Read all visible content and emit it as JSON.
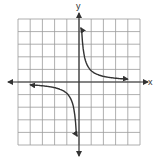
{
  "chart_data": {
    "type": "line",
    "title": "",
    "xlabel": "x",
    "ylabel": "y",
    "xlim": [
      -5,
      5
    ],
    "ylim": [
      -5,
      5
    ],
    "grid": true,
    "grid_step": 1,
    "legend": null,
    "function": "y = 1/x (rectangular hyperbola)",
    "series": [
      {
        "name": "branch-quadrant-I",
        "x": [
          0.15,
          0.25,
          0.5,
          1,
          2,
          3,
          4
        ],
        "y": [
          4.3,
          3.0,
          1.6,
          0.9,
          0.45,
          0.3,
          0.2
        ],
        "arrows": "both"
      },
      {
        "name": "branch-quadrant-III",
        "x": [
          -4,
          -3,
          -2,
          -1,
          -0.5,
          -0.25,
          -0.15
        ],
        "y": [
          -0.2,
          -0.3,
          -0.45,
          -0.9,
          -1.6,
          -3.0,
          -4.3
        ],
        "arrows": "both"
      }
    ]
  },
  "axes": {
    "x_label": "x",
    "y_label": "y"
  },
  "style": {
    "grid_color": "#9a9a9a",
    "axis_color": "#333333",
    "curve_color": "#333333"
  }
}
